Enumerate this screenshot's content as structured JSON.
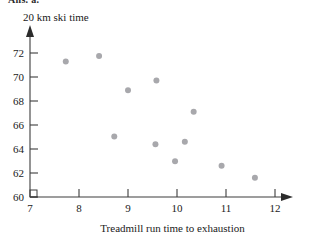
{
  "figure": {
    "clipped_header": "Ans. a.",
    "y_axis_title": "20 km ski time",
    "x_axis_title": "Treadmill run time to exhaustion",
    "point_color": "#a8a8ac",
    "axis_color": "#3c3c3c"
  },
  "chart_data": {
    "type": "scatter",
    "title": "",
    "xlabel": "Treadmill run time to exhaustion",
    "ylabel": "20 km ski time",
    "xlim": [
      7,
      12.5
    ],
    "ylim": [
      60,
      73
    ],
    "xticks": [
      7,
      8,
      9,
      10,
      11,
      12
    ],
    "yticks": [
      60,
      62,
      64,
      66,
      68,
      70,
      72
    ],
    "xtick_labels": [
      "7",
      "8",
      "9",
      "10",
      "11",
      "12"
    ],
    "ytick_labels": [
      "60",
      "62",
      "64",
      "66",
      "68",
      "70",
      "72"
    ],
    "grid": false,
    "legend": false,
    "axis_break": true,
    "series": [
      {
        "name": "skiers",
        "x": [
          7.73,
          8.41,
          8.72,
          9.0,
          9.56,
          9.58,
          9.96,
          10.16,
          10.34,
          10.91,
          11.59
        ],
        "y": [
          71.3,
          71.75,
          65.05,
          68.9,
          64.4,
          69.7,
          62.97,
          64.6,
          67.1,
          62.6,
          61.6
        ]
      }
    ]
  }
}
